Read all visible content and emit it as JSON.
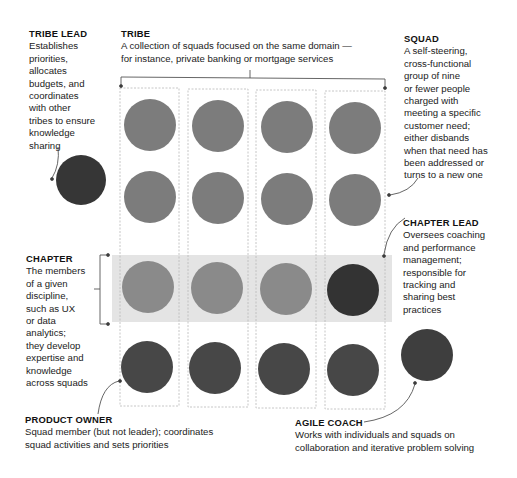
{
  "colors": {
    "squad_member": "#7c7c7c",
    "chapter_member": "#8a8a8a",
    "product_owner": "#474747",
    "lead": "#333333",
    "chapter_band": "#e4e4e4",
    "column_border": "#b5b5b5",
    "line": "#555555"
  },
  "labels": {
    "tribe_lead": {
      "title": "TRIBE LEAD",
      "lines": [
        "Establishes",
        "priorities,",
        "allocates",
        "budgets, and",
        "coordinates",
        "with other",
        "tribes to ensure",
        "knowledge",
        "sharing"
      ]
    },
    "tribe": {
      "title": "TRIBE",
      "lines": [
        "A collection of squads focused on the same domain —",
        "for instance, private banking or mortgage services"
      ]
    },
    "squad": {
      "title": "SQUAD",
      "lines": [
        "A self-steering,",
        "cross-functional",
        "group of nine",
        "or fewer people",
        "charged with",
        "meeting a specific",
        "customer need;",
        "either disbands",
        "when that need has",
        "been addressed or",
        "turns to a new one"
      ]
    },
    "chapter_lead": {
      "title": "CHAPTER LEAD",
      "lines": [
        "Oversees coaching",
        "and performance",
        "management;",
        "responsible for",
        "tracking and",
        "sharing best",
        "practices"
      ]
    },
    "chapter": {
      "title": "CHAPTER",
      "lines": [
        "The members",
        "of a given",
        "discipline,",
        "such as UX",
        "or data",
        "analytics;",
        "they develop",
        "expertise and",
        "knowledge",
        "across squads"
      ]
    },
    "product_owner": {
      "title": "PRODUCT OWNER",
      "lines": [
        "Squad member (but not leader); coordinates",
        "squad activities and sets priorities"
      ]
    },
    "agile_coach": {
      "title": "AGILE COACH",
      "lines": [
        "Works with individuals and squads on",
        "collaboration and iterative problem solving"
      ]
    }
  },
  "grid": {
    "columns": 4,
    "rows": [
      {
        "role": "squad member",
        "cells": [
          "member",
          "member",
          "member",
          "member"
        ]
      },
      {
        "role": "squad member",
        "cells": [
          "member",
          "member",
          "member",
          "member"
        ]
      },
      {
        "role": "chapter",
        "cells": [
          "chapter-member",
          "chapter-member",
          "chapter-member",
          "chapter-lead"
        ]
      },
      {
        "role": "product owner",
        "cells": [
          "product-owner",
          "product-owner",
          "product-owner",
          "product-owner"
        ]
      }
    ]
  }
}
